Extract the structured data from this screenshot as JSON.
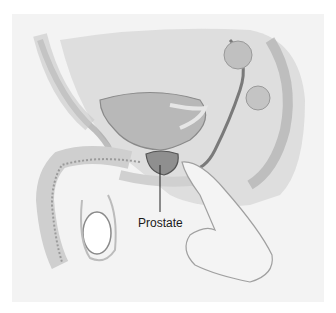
{
  "illustration": {
    "subject": "male pelvis sagittal section with digital rectal exam",
    "labels": [
      {
        "text": "Prostate"
      }
    ]
  },
  "colors": {
    "background": "#ffffff",
    "panel": "#f3f3f3",
    "organ_fill": "#bdbdbd",
    "prostate_fill": "#8f8f8f",
    "line": "#555555",
    "label_text": "#1a1a1a"
  }
}
